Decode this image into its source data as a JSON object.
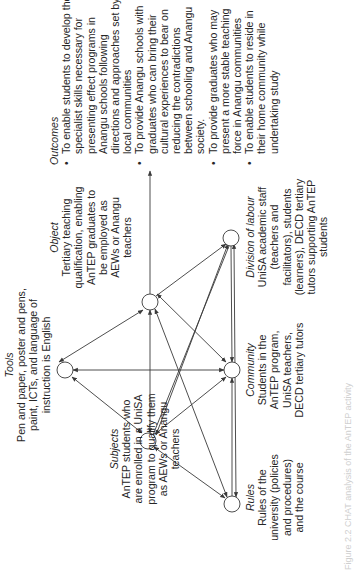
{
  "diagram": {
    "type": "activity-system",
    "rotation_deg": -90,
    "nodes": {
      "tools": {
        "heading": "Tools",
        "body": "Pen and paper, poster and pens, paint, ICTs, and language of instruction is English"
      },
      "subjects": {
        "heading": "Subjects",
        "body": "AnTEP students who are enrolled in a UniSA program to qualify them as AEWs or Anangu teachers"
      },
      "object": {
        "heading": "Object",
        "body": "Tertiary teaching qualification, enabling AnTEP graduates to be employed as AEWs or Anangu teachers"
      },
      "rules": {
        "heading": "Rules",
        "body": "Rules of the university (policies and procedures) and the course"
      },
      "community": {
        "heading": "Community",
        "body": "Students in the AnTEP program, UniSA teachers, DECD tertiary tutors"
      },
      "division_of_labour": {
        "heading": "Division of labour",
        "body": "UniSA academic staff (teachers and facilitators), students (learners), DECD tertiary tutors supporting AnTEP students"
      }
    },
    "outcomes": {
      "heading": "Outcomes",
      "items": [
        "To enable students to develop the specialist skills necessary for presenting effect programs in Anangu schools following directions and approaches set by local communities",
        "To provide Anangu schools with graduates who can bring their cultural experiences to bear on reducing the contradictions between schooling and Anangu society.",
        "To provide graduates who may present a more stable teaching force in Anangu communities",
        "To enable students to reside in their home community while undertaking study"
      ]
    },
    "caption": "Figure 2.2 CHAT analysis of the AnTEP activity",
    "colors": {
      "line": "#3a3a3a",
      "text": "#262626",
      "node_fill": "#ffffff"
    }
  }
}
